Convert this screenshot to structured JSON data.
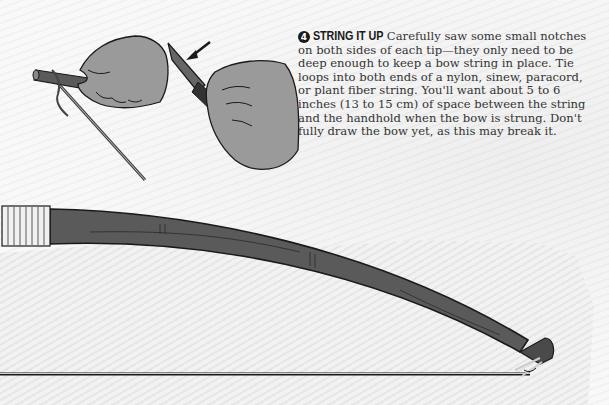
{
  "step": {
    "number": "4",
    "title": "STRING IT UP",
    "body": "Carefully saw some small notches on both sides of each tip—they only need to be deep enough to keep a bow string in place. Tie loops into both ends of a nylon, sinew, paracord, or plant fiber string. You'll want about 5 to 6 inches (13 to 15 cm) of space between the string and the handhold when the bow is strung. Don't fully draw the bow yet, as this may break it."
  },
  "illustrations": {
    "hands": "hands-notching-bow-tip-with-knife",
    "arrow": "pointer-arrow",
    "bow": "strung-bow"
  },
  "colors": {
    "bow": "#5a5a5a",
    "outline": "#1a1a1a",
    "skin": "#9a9a9a",
    "background": "#f7f7f7"
  }
}
